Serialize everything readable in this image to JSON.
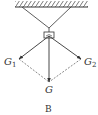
{
  "diagram": {
    "type": "force-decomposition",
    "colors": {
      "stroke": "#333333",
      "dashed": "#555555",
      "background": "#ffffff"
    },
    "ceiling": {
      "x1": 15,
      "x2": 88,
      "y": 7
    },
    "ropes": {
      "left_anchor": [
        22,
        7
      ],
      "right_anchor": [
        71,
        7
      ],
      "junction": [
        49,
        28
      ]
    },
    "object": {
      "x": 44,
      "y": 32,
      "width": 10,
      "height": 6
    },
    "origin": [
      49,
      36
    ],
    "forces": [
      {
        "name": "G1",
        "tip": [
          19,
          59
        ],
        "label": "G",
        "subscript": "1"
      },
      {
        "name": "G2",
        "tip": [
          81,
          59
        ],
        "label": "G",
        "subscript": "2"
      },
      {
        "name": "G",
        "tip": [
          49,
          82
        ],
        "label": "G",
        "subscript": ""
      }
    ],
    "caption": "B"
  }
}
